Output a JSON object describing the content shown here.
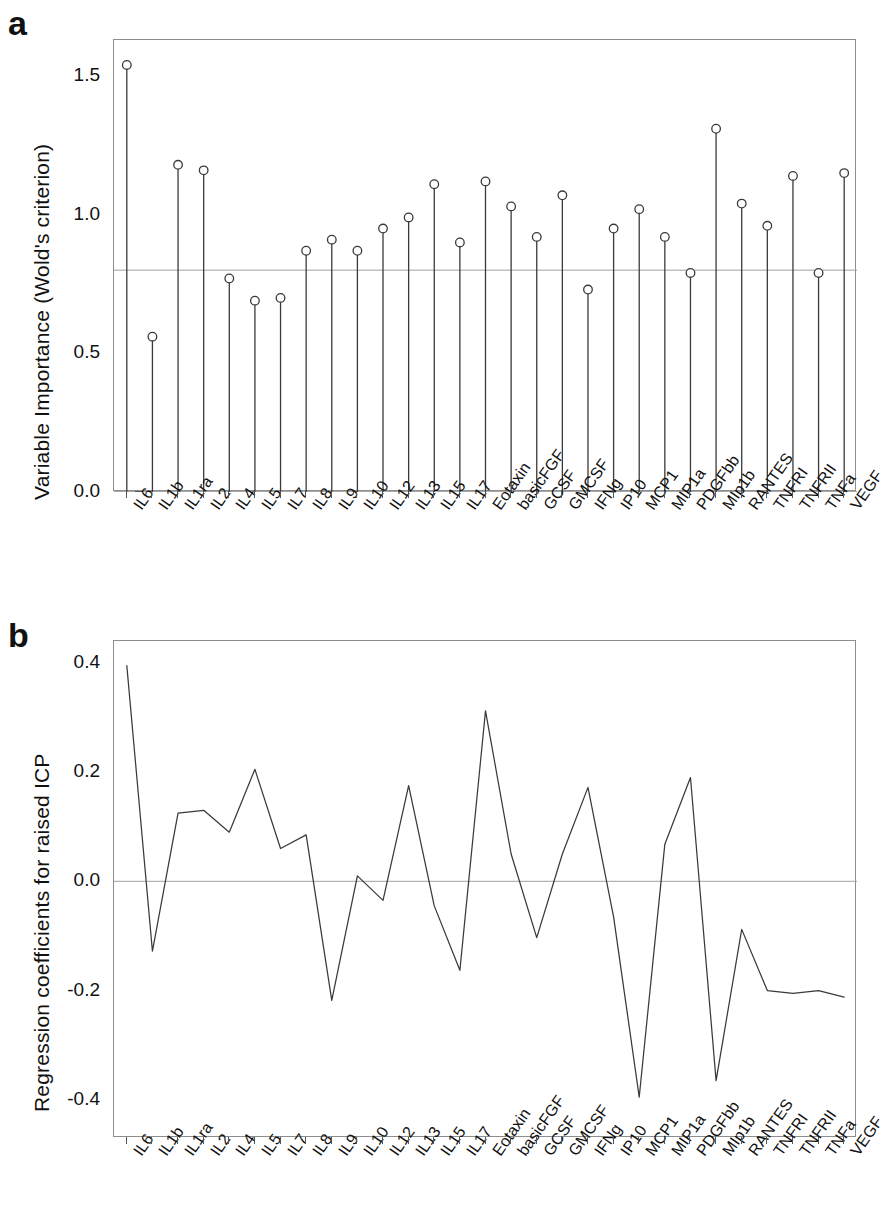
{
  "figure": {
    "panels": [
      {
        "letter": "a",
        "ylabel": "Variable Importance (Wold's criterion)"
      },
      {
        "letter": "b",
        "ylabel": "Regression coefficients for raised ICP"
      }
    ]
  },
  "categories": [
    "IL6",
    "IL1b",
    "IL1ra",
    "IL2",
    "IL4",
    "IL5",
    "IL7",
    "IL8",
    "IL9",
    "IL10",
    "IL12",
    "IL13",
    "IL15",
    "IL17",
    "Eotaxin",
    "basicFGF",
    "GCSF",
    "GMCSF",
    "IFNg",
    "IP10",
    "MCP1",
    "MIP1a",
    "PDGFbb",
    "MIp1b",
    "RANTES",
    "TNFRI",
    "TNFRII",
    "TNFa",
    "VEGF"
  ],
  "chart_data": [
    {
      "type": "bar",
      "subtype": "stem-lollipop",
      "panel": "a",
      "title": "",
      "xlabel": "",
      "ylabel": "Variable Importance (Wold's criterion)",
      "ylim": [
        0.0,
        1.63
      ],
      "yticks": [
        0.0,
        0.5,
        1.0,
        1.5
      ],
      "ytick_labels": [
        "0.0",
        "0.5",
        "1.0",
        "1.5"
      ],
      "grid": false,
      "legend": "none",
      "reference_line": 0.8,
      "categories": [
        "IL6",
        "IL1b",
        "IL1ra",
        "IL2",
        "IL4",
        "IL5",
        "IL7",
        "IL8",
        "IL9",
        "IL10",
        "IL12",
        "IL13",
        "IL15",
        "IL17",
        "Eotaxin",
        "basicFGF",
        "GCSF",
        "GMCSF",
        "IFNg",
        "IP10",
        "MCP1",
        "MIP1a",
        "PDGFbb",
        "MIp1b",
        "RANTES",
        "TNFRI",
        "TNFRII",
        "TNFa",
        "VEGF"
      ],
      "values": [
        1.54,
        0.56,
        1.18,
        1.16,
        0.77,
        0.69,
        0.7,
        0.87,
        0.91,
        0.87,
        0.95,
        0.99,
        1.11,
        0.9,
        1.12,
        1.03,
        0.92,
        1.07,
        0.73,
        0.95,
        1.02,
        0.92,
        0.79,
        1.31,
        1.04,
        0.96,
        1.14,
        0.79,
        1.15
      ]
    },
    {
      "type": "line",
      "panel": "b",
      "title": "",
      "xlabel": "",
      "ylabel": "Regression coefficients for raised ICP",
      "ylim": [
        -0.47,
        0.44
      ],
      "yticks": [
        -0.4,
        -0.2,
        0.0,
        0.2,
        0.4
      ],
      "ytick_labels": [
        "-0.4",
        "-0.2",
        "0.0",
        "0.2",
        "0.4"
      ],
      "grid": false,
      "legend": "none",
      "reference_line": 0.0,
      "categories": [
        "IL6",
        "IL1b",
        "IL1ra",
        "IL2",
        "IL4",
        "IL5",
        "IL7",
        "IL8",
        "IL9",
        "IL10",
        "IL12",
        "IL13",
        "IL15",
        "IL17",
        "Eotaxin",
        "basicFGF",
        "GCSF",
        "GMCSF",
        "IFNg",
        "IP10",
        "MCP1",
        "MIP1a",
        "PDGFbb",
        "MIp1b",
        "RANTES",
        "TNFRI",
        "TNFRII",
        "TNFa",
        "VEGF"
      ],
      "values": [
        0.395,
        -0.128,
        0.125,
        0.13,
        0.09,
        0.205,
        0.06,
        0.085,
        -0.218,
        0.01,
        -0.035,
        0.175,
        -0.045,
        -0.163,
        0.312,
        0.05,
        -0.103,
        0.05,
        0.172,
        -0.065,
        -0.395,
        0.068,
        0.19,
        -0.365,
        -0.088,
        -0.2,
        -0.205,
        -0.2,
        -0.212
      ]
    }
  ],
  "style": {
    "axis_color": "#8d8d8d",
    "line_color": "#3a3a3a",
    "marker_fill": "#ffffff",
    "reference_color": "#a0a0a0",
    "text_color": "#111111"
  }
}
